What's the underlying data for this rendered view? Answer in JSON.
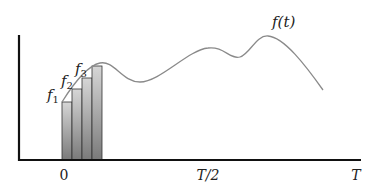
{
  "diagram": {
    "curve_label": "f(t)",
    "bar_labels": [
      {
        "base": "f",
        "sub": "1"
      },
      {
        "base": "f",
        "sub": "2"
      },
      {
        "base": "f",
        "sub": "3"
      }
    ],
    "x_axis": {
      "ticks": [
        {
          "label": "0",
          "x": 64
        },
        {
          "label": "T/2",
          "x": 208
        },
        {
          "label": "T",
          "x": 356
        }
      ]
    },
    "bars": [
      {
        "x": 62,
        "top": 102
      },
      {
        "x": 72,
        "top": 89
      },
      {
        "x": 82,
        "top": 78
      },
      {
        "x": 92,
        "top": 66
      }
    ],
    "bar_width": 10,
    "colors": {
      "axis": "#111111",
      "curve": "#8a8a8a",
      "bar_top": "#d6d6d6",
      "bar_bottom": "#7a7a7a",
      "bar_edge": "#333333"
    }
  }
}
